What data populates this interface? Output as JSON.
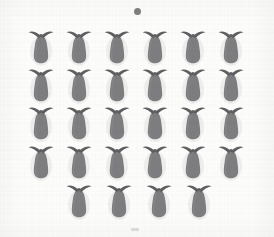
{
  "image": {
    "title": "Scanned grid of decorative vase motifs",
    "width": 274,
    "height": 237,
    "background_color": "#fcfcfb",
    "panel_color": "#fdfdfc"
  },
  "palette": {
    "body_fill": "#7e7e80",
    "body_fill_light": "#8d8d8f",
    "wing_stroke": "#5f5f62",
    "halo": "#eceaea",
    "dot_color": "#6e6e70",
    "bottom_mark_color": "#b9b9bb"
  },
  "marks": {
    "top_dot": {
      "name": "top-center-dot",
      "x": 134,
      "y": 8,
      "size": 7
    },
    "bottom_mark": {
      "name": "bottom-center-smudge",
      "x": 131,
      "y": 228,
      "width": 8,
      "height": 3
    }
  },
  "grid": {
    "columns": 6,
    "full_rows": 4,
    "last_row_count": 4,
    "total_motifs": 28,
    "cell_width": 34,
    "cell_height": 38,
    "col_step": 38,
    "row_step": 38,
    "origin_x": 24,
    "origin_y": 28,
    "last_row_origin_x": 62,
    "last_row_y": 182,
    "last_row_step": 40
  },
  "motif": {
    "name": "vase-with-wings",
    "description": "rounded teardrop body with two curved arc wings above",
    "body_shape": "teardrop",
    "wing_count": 2
  },
  "rows": [
    {
      "index": 1,
      "label": "row-1",
      "y": 28,
      "count": 6,
      "items": [
        {
          "label": "motif-r1c1",
          "x": 24
        },
        {
          "label": "motif-r1c2",
          "x": 62
        },
        {
          "label": "motif-r1c3",
          "x": 100
        },
        {
          "label": "motif-r1c4",
          "x": 138
        },
        {
          "label": "motif-r1c5",
          "x": 176
        },
        {
          "label": "motif-r1c6",
          "x": 214
        }
      ]
    },
    {
      "index": 2,
      "label": "row-2",
      "y": 66,
      "count": 6,
      "items": [
        {
          "label": "motif-r2c1",
          "x": 24
        },
        {
          "label": "motif-r2c2",
          "x": 62
        },
        {
          "label": "motif-r2c3",
          "x": 100
        },
        {
          "label": "motif-r2c4",
          "x": 138
        },
        {
          "label": "motif-r2c5",
          "x": 176
        },
        {
          "label": "motif-r2c6",
          "x": 214
        }
      ]
    },
    {
      "index": 3,
      "label": "row-3",
      "y": 104,
      "count": 6,
      "items": [
        {
          "label": "motif-r3c1",
          "x": 24
        },
        {
          "label": "motif-r3c2",
          "x": 62
        },
        {
          "label": "motif-r3c3",
          "x": 100
        },
        {
          "label": "motif-r3c4",
          "x": 138
        },
        {
          "label": "motif-r3c5",
          "x": 176
        },
        {
          "label": "motif-r3c6",
          "x": 214
        }
      ]
    },
    {
      "index": 4,
      "label": "row-4",
      "y": 143,
      "count": 6,
      "items": [
        {
          "label": "motif-r4c1",
          "x": 24
        },
        {
          "label": "motif-r4c2",
          "x": 62
        },
        {
          "label": "motif-r4c3",
          "x": 100
        },
        {
          "label": "motif-r4c4",
          "x": 138
        },
        {
          "label": "motif-r4c5",
          "x": 176
        },
        {
          "label": "motif-r4c6",
          "x": 214
        }
      ]
    },
    {
      "index": 5,
      "label": "row-5",
      "y": 182,
      "count": 4,
      "items": [
        {
          "label": "motif-r5c1",
          "x": 62
        },
        {
          "label": "motif-r5c2",
          "x": 102
        },
        {
          "label": "motif-r5c3",
          "x": 142
        },
        {
          "label": "motif-r5c4",
          "x": 182
        }
      ]
    }
  ]
}
